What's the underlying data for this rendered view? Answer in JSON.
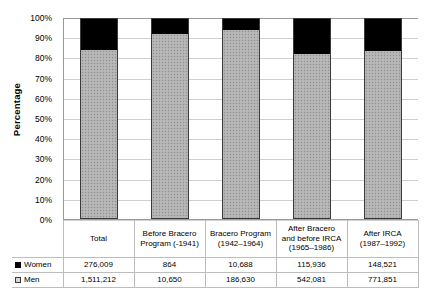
{
  "chart_data": {
    "type": "bar",
    "stacked": true,
    "normalized": true,
    "title": "",
    "xlabel": "",
    "ylabel": "Percentage",
    "ylim": [
      0,
      100
    ],
    "ytick_labels": [
      "100%",
      "90%",
      "80%",
      "70%",
      "60%",
      "50%",
      "40%",
      "30%",
      "20%",
      "10%",
      "0%"
    ],
    "ytick_values": [
      100,
      90,
      80,
      70,
      60,
      50,
      40,
      30,
      20,
      10,
      0
    ],
    "grid": true,
    "legend_position": "table-left",
    "categories": [
      "Total",
      "Before Bracero Program (-1941)",
      "Bracero Program (1942–1964)",
      "After Bracero and before IRCA (1965–1986)",
      "After IRCA (1987–1992)"
    ],
    "category_lines": [
      [
        "Total"
      ],
      [
        "Before Bracero",
        "Program (-1941)"
      ],
      [
        "Bracero Program",
        "(1942–1964)"
      ],
      [
        "After Bracero",
        "and before IRCA",
        "(1965–1986)"
      ],
      [
        "After IRCA",
        "(1987–1992)"
      ]
    ],
    "series": [
      {
        "name": "Women",
        "color": "#000000",
        "values": [
          276009,
          864,
          10688,
          115936,
          148521
        ],
        "value_labels": [
          "276,009",
          "864",
          "10,688",
          "115,936",
          "148,521"
        ],
        "percentages": [
          15.4,
          7.5,
          5.4,
          17.6,
          16.1
        ]
      },
      {
        "name": "Men",
        "color": "#b2b2b2",
        "values": [
          1511212,
          10650,
          186630,
          542081,
          771851
        ],
        "value_labels": [
          "1,511,212",
          "10,650",
          "186,630",
          "542,081",
          "771,851"
        ],
        "percentages": [
          84.6,
          92.5,
          94.6,
          82.4,
          83.9
        ]
      }
    ]
  },
  "legend": {
    "women_label": "Women",
    "men_label": "Men"
  }
}
